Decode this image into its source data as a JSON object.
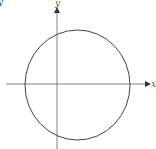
{
  "diagram": {
    "type": "circle-on-axes",
    "axes": {
      "x_label": "x",
      "y_label": "y",
      "origin_px": [
        57,
        84
      ],
      "x_axis_px": [
        6,
        150
      ],
      "y_axis_px": [
        7,
        149
      ]
    },
    "circle": {
      "center_px": [
        77,
        85
      ],
      "radius_px": [
        53,
        55
      ],
      "stroke": "#444444"
    },
    "corner_mark": "y",
    "colors": {
      "axis": "#555555",
      "curve": "#444444",
      "background": "#ffffff"
    }
  }
}
